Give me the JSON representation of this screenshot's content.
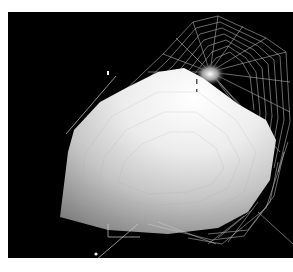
{
  "scene": {
    "description": "3D rendered shaded surface with wireframe mesh on black background",
    "background_color": "#000000",
    "page_color": "#ffffff",
    "surface_color_light": "#f4f4f4",
    "surface_color_dark": "#8a8a8a",
    "wireframe_color": "#d8d8d8"
  }
}
